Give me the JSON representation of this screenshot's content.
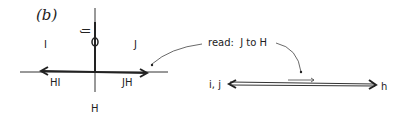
{
  "panel_label": "(b)",
  "left_diagram": {
    "vertical_axis_top_label": "IJ",
    "vertical_axis_bottom_label": "H",
    "quadrant_left_label": "I",
    "quadrant_right_label": "J",
    "left_arrow_label": "HI",
    "right_arrow_label": "JH",
    "origin_marker": "0"
  },
  "annotation": {
    "text": "read:  J to H"
  },
  "right_diagram": {
    "left_label": "i, j",
    "right_label": "h"
  }
}
